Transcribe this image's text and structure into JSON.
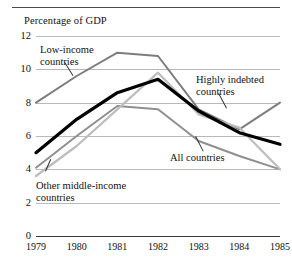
{
  "chart_data": {
    "type": "line",
    "title": "Percentage of GDP",
    "xlabel": "",
    "ylabel": "Percentage of GDP",
    "x": [
      "1979",
      "1980",
      "1981",
      "1982",
      "1983",
      "1984",
      "1985"
    ],
    "categories": [
      "1979",
      "1980",
      "1981",
      "1982",
      "1983",
      "1984",
      "1985"
    ],
    "ylim": [
      0,
      12
    ],
    "yticks": [
      "0",
      "2",
      "4",
      "6",
      "8",
      "10",
      "12"
    ],
    "ytick_values": [
      0,
      2,
      4,
      6,
      8,
      10,
      12
    ],
    "grid": "horizontal",
    "legend": "inline-callout-labels",
    "series": [
      {
        "name": "Low-income countries",
        "color": "#7d7d7d",
        "width": 2.0,
        "values": [
          8.0,
          9.6,
          11.0,
          10.8,
          7.6,
          6.4,
          8.0
        ]
      },
      {
        "name": "All countries",
        "color": "#000000",
        "width": 3.2,
        "values": [
          5.0,
          7.0,
          8.6,
          9.4,
          7.5,
          6.2,
          5.5
        ]
      },
      {
        "name": "Highly indebted countries",
        "color": "#bdbdbd",
        "width": 2.2,
        "values": [
          3.6,
          5.4,
          7.6,
          9.8,
          7.3,
          6.5,
          4.0
        ]
      },
      {
        "name": "Other middle-income countries",
        "color": "#8f8f8f",
        "width": 2.0,
        "values": [
          4.1,
          6.0,
          7.8,
          7.6,
          5.7,
          4.8,
          4.0
        ]
      }
    ],
    "annotations": [
      {
        "id": "low",
        "text_line1": "Low-income",
        "text_line2": "countries"
      },
      {
        "id": "high",
        "text_line1": "Highly indebted",
        "text_line2": "countries"
      },
      {
        "id": "all",
        "text_line1": "All countries",
        "text_line2": ""
      },
      {
        "id": "other",
        "text_line1": "Other middle-income",
        "text_line2": "countries"
      }
    ]
  }
}
